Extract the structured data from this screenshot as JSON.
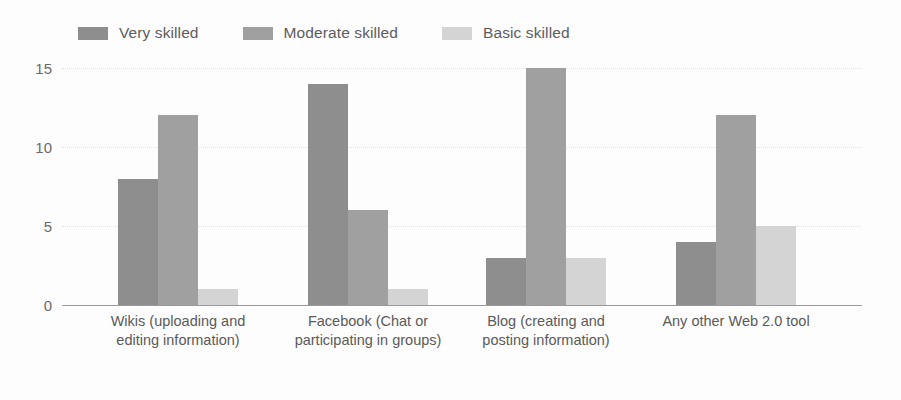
{
  "chart_data": {
    "type": "bar",
    "title": "",
    "subtitle": "",
    "xlabel": "",
    "ylabel": "",
    "ylim": [
      0,
      16
    ],
    "yticks": [
      0,
      5,
      10,
      15
    ],
    "ytick_labels": [
      "0",
      "5",
      "10",
      "15"
    ],
    "grid": true,
    "legend_position": "top",
    "orientation": "vertical",
    "grouping": "grouped",
    "categories": [
      "Wikis (uploading and editing information)",
      "Facebook (Chat or participating in groups)",
      "Blog (creating and posting information)",
      "Any other Web 2.0 tool"
    ],
    "series": [
      {
        "name": "Very skilled",
        "color": "#8e8e8e",
        "values": [
          8,
          14,
          3,
          4
        ]
      },
      {
        "name": "Moderate skilled",
        "color": "#a0a0a0",
        "values": [
          12,
          6,
          15,
          12
        ]
      },
      {
        "name": "Basic skilled",
        "color": "#d4d4d4",
        "values": [
          1,
          1,
          3,
          5
        ]
      }
    ]
  },
  "legend": {
    "items": [
      {
        "label": "Very skilled",
        "swatch": "#8e8e8e"
      },
      {
        "label": "Moderate skilled",
        "swatch": "#a0a0a0"
      },
      {
        "label": "Basic skilled",
        "swatch": "#d4d4d4"
      }
    ]
  },
  "axis": {
    "y_tick_labels": [
      "15",
      "10",
      "5",
      "0"
    ]
  }
}
